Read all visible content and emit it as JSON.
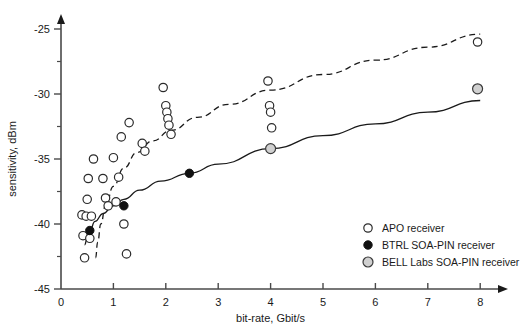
{
  "chart_data": {
    "type": "scatter",
    "title": "",
    "xlabel": "bit-rate, Gbit/s",
    "ylabel": "sensitivity, dBm",
    "xlim": [
      0,
      8
    ],
    "ylim": [
      -45,
      -24
    ],
    "xticks": [
      0,
      1,
      2,
      3,
      4,
      5,
      6,
      7,
      8
    ],
    "xtick_labels": [
      "0",
      "1",
      "2",
      "3",
      "4",
      "5",
      "6",
      "7",
      "8"
    ],
    "yticks": [
      -45,
      -40,
      -35,
      -30,
      -25
    ],
    "ytick_labels": [
      "-45",
      "-40",
      "-35",
      "-30",
      "-25"
    ],
    "y_minor_ticks": [
      -42.5,
      -37.5,
      -32.5,
      -27.5
    ],
    "grid": false,
    "legend_position": "bottom-right",
    "series": [
      {
        "name": "APO receiver",
        "marker": "open-circle",
        "marker_color": "#ffffff",
        "edge_color": "#2b2b2b",
        "points": [
          [
            0.4,
            -39.3
          ],
          [
            0.42,
            -40.9
          ],
          [
            0.45,
            -42.6
          ],
          [
            0.48,
            -39.4
          ],
          [
            0.5,
            -38.1
          ],
          [
            0.52,
            -36.5
          ],
          [
            0.55,
            -41.1
          ],
          [
            0.58,
            -39.4
          ],
          [
            0.62,
            -35.0
          ],
          [
            0.8,
            -36.5
          ],
          [
            0.85,
            -38.0
          ],
          [
            0.9,
            -38.6
          ],
          [
            1.0,
            -34.9
          ],
          [
            1.05,
            -38.3
          ],
          [
            1.1,
            -36.4
          ],
          [
            1.15,
            -33.3
          ],
          [
            1.2,
            -40.0
          ],
          [
            1.25,
            -42.3
          ],
          [
            1.3,
            -32.2
          ],
          [
            1.55,
            -33.8
          ],
          [
            1.6,
            -34.4
          ],
          [
            1.95,
            -29.5
          ],
          [
            2.0,
            -30.9
          ],
          [
            2.02,
            -31.4
          ],
          [
            2.04,
            -31.9
          ],
          [
            2.06,
            -32.4
          ],
          [
            2.1,
            -33.1
          ],
          [
            3.95,
            -29.0
          ],
          [
            3.98,
            -30.9
          ],
          [
            4.0,
            -31.4
          ],
          [
            4.02,
            -32.6
          ],
          [
            7.95,
            -26.0
          ]
        ]
      },
      {
        "name": "BTRL SOA-PIN receiver",
        "marker": "filled-circle",
        "marker_color": "#111111",
        "edge_color": "#111111",
        "points": [
          [
            0.55,
            -40.5
          ],
          [
            1.2,
            -38.6
          ],
          [
            2.45,
            -36.1
          ]
        ]
      },
      {
        "name": "BELL Labs SOA-PIN receiver",
        "marker": "gray-circle",
        "marker_color": "#d0d0d0",
        "edge_color": "#3a3a3a",
        "points": [
          [
            4.0,
            -34.2
          ],
          [
            7.95,
            -29.6
          ]
        ]
      }
    ],
    "curves": [
      {
        "name": "APO trend",
        "style": "dashed",
        "color": "#1a1a1a",
        "points": [
          [
            0.66,
            -42.6
          ],
          [
            0.7,
            -41.4
          ],
          [
            0.76,
            -40.0
          ],
          [
            0.85,
            -38.6
          ],
          [
            1.0,
            -37.1
          ],
          [
            1.2,
            -35.7
          ],
          [
            1.45,
            -34.5
          ],
          [
            1.75,
            -33.6
          ],
          [
            2.1,
            -32.8
          ],
          [
            2.6,
            -31.8
          ],
          [
            3.2,
            -30.8
          ],
          [
            4.0,
            -29.7
          ],
          [
            5.0,
            -28.5
          ],
          [
            6.0,
            -27.4
          ],
          [
            7.0,
            -26.4
          ],
          [
            8.0,
            -25.4
          ]
        ]
      },
      {
        "name": "SOA-PIN trend",
        "style": "solid",
        "color": "#1a1a1a",
        "points": [
          [
            0.45,
            -41.6
          ],
          [
            0.5,
            -41.1
          ],
          [
            0.55,
            -40.5
          ],
          [
            0.65,
            -39.8
          ],
          [
            0.8,
            -39.2
          ],
          [
            1.0,
            -38.6
          ],
          [
            1.2,
            -38.1
          ],
          [
            1.5,
            -37.4
          ],
          [
            1.9,
            -36.7
          ],
          [
            2.45,
            -36.1
          ],
          [
            3.0,
            -35.4
          ],
          [
            4.0,
            -34.2
          ],
          [
            5.0,
            -33.2
          ],
          [
            6.0,
            -32.3
          ],
          [
            7.0,
            -31.4
          ],
          [
            8.0,
            -30.5
          ]
        ]
      }
    ]
  },
  "legend": {
    "items": [
      {
        "label": "APO receiver",
        "marker": "open-circle"
      },
      {
        "label": "BTRL SOA-PIN receiver",
        "marker": "filled-circle"
      },
      {
        "label": "BELL Labs SOA-PIN receiver",
        "marker": "gray-circle"
      }
    ]
  },
  "colors": {
    "axis": "#4a4a4a",
    "text": "#1a1a1a",
    "open_marker_fill": "#ffffff",
    "filled_marker": "#111111",
    "gray_marker": "#d0d0d0",
    "background": "#ffffff"
  }
}
